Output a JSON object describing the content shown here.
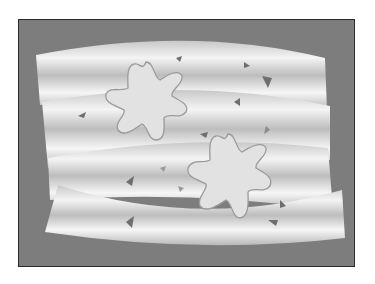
{
  "illustration": {
    "description": "Gray framed illustration of wavy silver fabric ribbons with two eight-petal flower shapes and scattered small triangles",
    "colors": {
      "background": "#ffffff",
      "frame": "#7d7d7d",
      "frame_border": "#2a2a2a",
      "ribbon_light": "#f2f2f2",
      "ribbon_dark": "#b4b4b4",
      "flower_fill": "#e2e2e2",
      "flower_stroke": "#9a9a9a",
      "triangle": "#6e6e6e"
    },
    "flowers": [
      {
        "cx": 146,
        "cy": 100,
        "r": 40
      },
      {
        "cx": 228,
        "cy": 176,
        "r": 42
      }
    ]
  }
}
